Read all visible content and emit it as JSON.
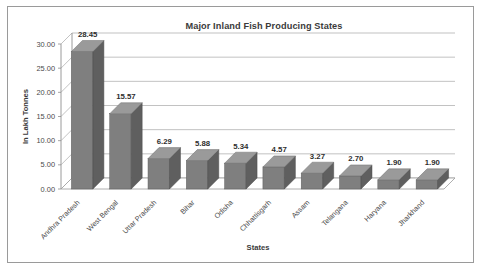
{
  "chart_data": {
    "type": "bar",
    "title": "Major Inland Fish Producing States",
    "xlabel": "States",
    "ylabel": "In Lakh Tonnes",
    "categories": [
      "Andhra Pradesh",
      "West Bengal",
      "Uttar Pradesh",
      "Bihar",
      "Odisha",
      "Chhattisgarh",
      "Assam",
      "Telangana",
      "Haryana",
      "Jharkhand"
    ],
    "values": [
      28.45,
      15.57,
      6.29,
      5.88,
      5.34,
      4.57,
      3.27,
      2.7,
      1.9,
      1.9
    ],
    "value_labels": [
      "28.45",
      "15.57",
      "6.29",
      "5.88",
      "5.34",
      "4.57",
      "3.27",
      "2.70",
      "1.90",
      "1.90"
    ],
    "ylim": [
      0,
      30
    ],
    "ytick_values": [
      0,
      5,
      10,
      15,
      20,
      25,
      30
    ],
    "ytick_labels": [
      "0.00",
      "5.00",
      "10.00",
      "15.00",
      "20.00",
      "25.00",
      "30.00"
    ],
    "grid": true,
    "legend": null,
    "style": "3d-column",
    "bar_color": "#7f7f7f",
    "bar_side_color": "#5f5f5f",
    "bar_top_color": "#9a9a9a",
    "grid_color": "#a8a8a8",
    "border_color": "#9a9a9a",
    "text_color": "#3b3b3b",
    "background": "#ffffff"
  }
}
